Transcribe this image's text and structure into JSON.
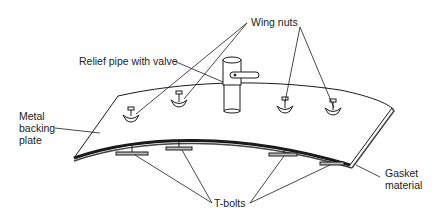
{
  "diagram": {
    "type": "technical-illustration",
    "labels": {
      "wing_nuts": "Wing nuts",
      "relief_pipe": "Relief pipe with valve",
      "metal_backing_plate": "Metal\nbacking\nplate",
      "gasket_material": "Gasket\nmaterial",
      "t_bolts": "T-bolts"
    },
    "colors": {
      "line": "#1a1a1a",
      "text": "#222222",
      "background": "#ffffff",
      "gasket": "#444444"
    }
  }
}
